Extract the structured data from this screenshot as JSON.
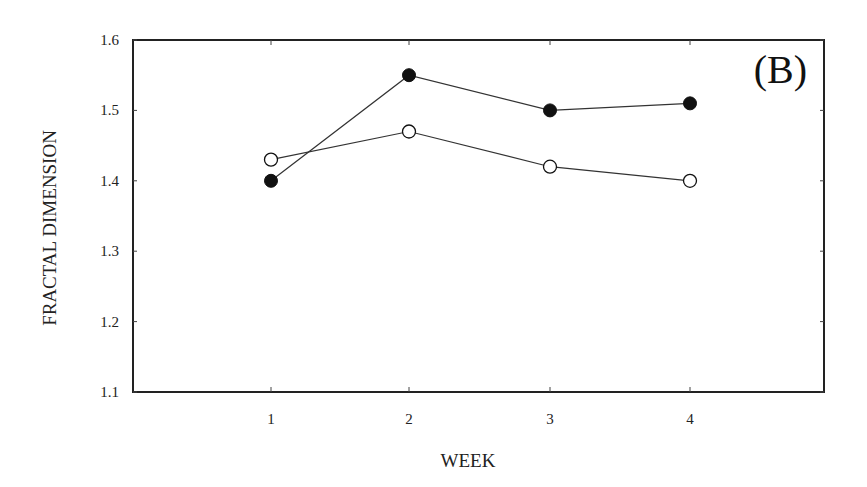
{
  "chart_data": {
    "type": "line",
    "title": "",
    "panel_label": "(B)",
    "xlabel": "WEEK",
    "ylabel": "FRACTAL DIMENSION",
    "x": [
      1,
      2,
      3,
      4
    ],
    "x_tick_labels": [
      "1",
      "2",
      "3",
      "4"
    ],
    "xlim": [
      0,
      5
    ],
    "ylim": [
      1.1,
      1.6
    ],
    "y_ticks": [
      1.1,
      1.2,
      1.3,
      1.4,
      1.5,
      1.6
    ],
    "y_tick_labels": [
      "1.1",
      "1.2",
      "1.3",
      "1.4",
      "1.5",
      "1.6"
    ],
    "grid": false,
    "legend": null,
    "series": [
      {
        "name": "filled circles",
        "marker": "filled-circle",
        "color": "#111111",
        "values": [
          1.4,
          1.55,
          1.5,
          1.51
        ]
      },
      {
        "name": "open circles",
        "marker": "open-circle",
        "color": "#111111",
        "values": [
          1.43,
          1.47,
          1.42,
          1.4
        ]
      }
    ]
  }
}
